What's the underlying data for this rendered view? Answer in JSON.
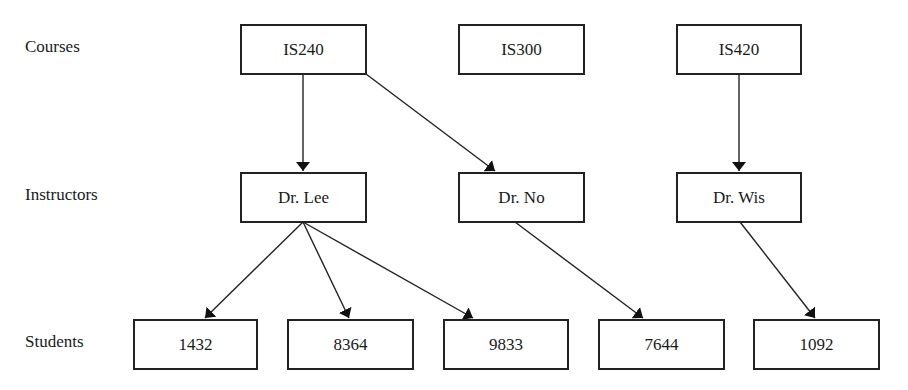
{
  "diagram": {
    "row_labels": {
      "courses": "Courses",
      "instructors": "Instructors",
      "students": "Students"
    },
    "courses": [
      {
        "id": "IS240",
        "label": "IS240"
      },
      {
        "id": "IS300",
        "label": "IS300"
      },
      {
        "id": "IS420",
        "label": "IS420"
      }
    ],
    "instructors": [
      {
        "id": "lee",
        "label": "Dr. Lee"
      },
      {
        "id": "no",
        "label": "Dr. No"
      },
      {
        "id": "wis",
        "label": "Dr. Wis"
      }
    ],
    "students": [
      {
        "id": "s1432",
        "label": "1432"
      },
      {
        "id": "s8364",
        "label": "8364"
      },
      {
        "id": "s9833",
        "label": "9833"
      },
      {
        "id": "s7644",
        "label": "7644"
      },
      {
        "id": "s1092",
        "label": "1092"
      }
    ],
    "edges": [
      {
        "from": "IS240",
        "to": "Dr. Lee"
      },
      {
        "from": "IS240",
        "to": "Dr. No"
      },
      {
        "from": "IS420",
        "to": "Dr. Wis"
      },
      {
        "from": "Dr. Lee",
        "to": "1432"
      },
      {
        "from": "Dr. Lee",
        "to": "8364"
      },
      {
        "from": "Dr. Lee",
        "to": "9833"
      },
      {
        "from": "Dr. No",
        "to": "7644"
      },
      {
        "from": "Dr. Wis",
        "to": "1092"
      }
    ],
    "colors": {
      "stroke": "#222222",
      "background": "#ffffff"
    }
  }
}
